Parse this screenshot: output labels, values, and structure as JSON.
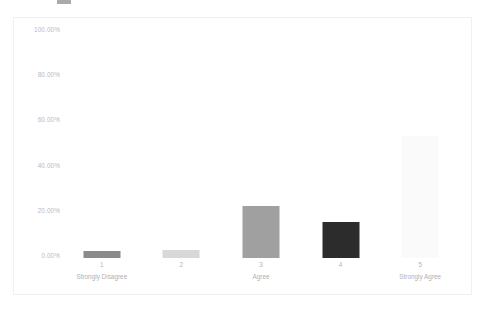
{
  "chart_data": {
    "type": "bar",
    "title": "",
    "subtitle": "",
    "xlabel": "",
    "ylabel": "",
    "categories": [
      "1",
      "2",
      "3",
      "4",
      "5"
    ],
    "category_sublabels": [
      "Strongly Disagree",
      "",
      "Agree",
      "",
      "Strongly Agree"
    ],
    "values": [
      3.0,
      3.5,
      23.0,
      16.0,
      54.0
    ],
    "value_labels": [
      "3.00%",
      "3.50%",
      "23.00%",
      "16.00%",
      "54.00%"
    ],
    "ylim": [
      0,
      100
    ],
    "y_ticks": [
      0,
      20,
      40,
      60,
      80,
      100
    ],
    "y_tick_labels": [
      "0.00%",
      "20.00%",
      "40.00%",
      "60.00%",
      "80.00%",
      "100.00%"
    ],
    "grid": false,
    "legend": "none",
    "bar_colors": [
      "#8a8a8a",
      "#d8d8d8",
      "#a0a0a0",
      "#2c2c2c",
      "#fafafa"
    ],
    "series": [
      {
        "name": "Response distribution",
        "values": [
          3.0,
          3.5,
          23.0,
          16.0,
          54.0
        ]
      }
    ]
  },
  "axes": {
    "y_tick_labels": [
      "100.00%",
      "80.00%",
      "60.00%",
      "40.00%",
      "20.00%",
      "0.00%"
    ],
    "x_items": [
      {
        "num": "1",
        "sub": "Strongly Disagree"
      },
      {
        "num": "2",
        "sub": ""
      },
      {
        "num": "3",
        "sub": "Agree"
      },
      {
        "num": "4",
        "sub": ""
      },
      {
        "num": "5",
        "sub": "Strongly Agree"
      }
    ]
  },
  "colors": {
    "background": "#ffffff",
    "frame": "#f1f1f3",
    "tick_text": "#b9b9bd",
    "label_text": "#b0b0b5"
  }
}
